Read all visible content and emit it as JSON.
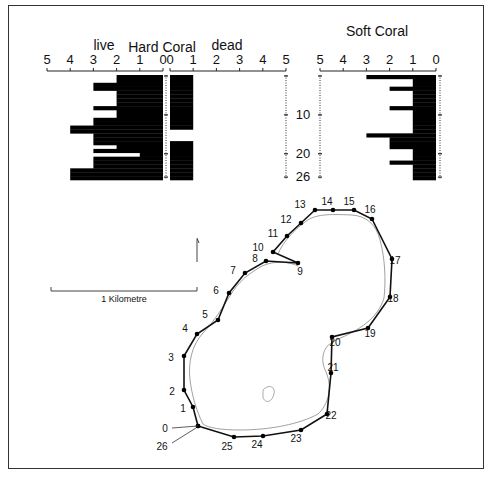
{
  "figure": {
    "hard_coral_title": "Hard Coral",
    "live_label": "live",
    "dead_label": "dead",
    "soft_coral_title": "Soft Coral",
    "scale_bar_label": "1 Kilometre",
    "depth_ticks": [
      "10",
      "20",
      "26"
    ]
  },
  "chart_data": [
    {
      "type": "bar",
      "orientation": "horizontal",
      "title": "Hard Coral — live",
      "xlabel": "live",
      "x_ticks": [
        "5",
        "4",
        "3",
        "2",
        "1",
        "0"
      ],
      "xlim": [
        5,
        0
      ],
      "categories": [
        0,
        1,
        2,
        3,
        4,
        5,
        6,
        7,
        8,
        9,
        10,
        11,
        12,
        13,
        14,
        15,
        16,
        17,
        18,
        19,
        20,
        21,
        22,
        23,
        24,
        25,
        26
      ],
      "values": [
        2,
        2,
        3,
        3,
        2,
        2,
        2,
        2,
        3,
        2,
        2,
        3,
        3,
        4,
        4,
        3,
        3,
        3,
        2,
        3,
        1,
        3,
        3,
        3,
        4,
        4,
        4
      ],
      "y_ticks": [
        "10",
        "20",
        "26"
      ]
    },
    {
      "type": "bar",
      "orientation": "horizontal",
      "title": "Hard Coral — dead",
      "xlabel": "dead",
      "x_ticks": [
        "0",
        "1",
        "2",
        "3",
        "4",
        "5"
      ],
      "xlim": [
        0,
        5
      ],
      "categories": [
        0,
        1,
        2,
        3,
        4,
        5,
        6,
        7,
        8,
        9,
        10,
        11,
        12,
        13,
        14,
        15,
        16,
        17,
        18,
        19,
        20,
        21,
        22,
        23,
        24,
        25,
        26
      ],
      "values": [
        1,
        1,
        1,
        1,
        1,
        1,
        1,
        1,
        1,
        1,
        1,
        1,
        1,
        1,
        0,
        0,
        0,
        1,
        1,
        1,
        1,
        1,
        1,
        1,
        1,
        1,
        1
      ],
      "y_ticks": [
        "10",
        "20",
        "26"
      ]
    },
    {
      "type": "bar",
      "orientation": "horizontal",
      "title": "Soft Coral",
      "x_ticks": [
        "5",
        "4",
        "3",
        "2",
        "1",
        "0"
      ],
      "xlim": [
        5,
        0
      ],
      "categories": [
        0,
        1,
        2,
        3,
        4,
        5,
        6,
        7,
        8,
        9,
        10,
        11,
        12,
        13,
        14,
        15,
        16,
        17,
        18,
        19,
        20,
        21,
        22,
        23,
        24,
        25,
        26
      ],
      "values": [
        3,
        1,
        1,
        2,
        1,
        1,
        1,
        1,
        2,
        1,
        1,
        1,
        1,
        1,
        1,
        3,
        2,
        2,
        2,
        1,
        1,
        1,
        2,
        1,
        1,
        1,
        1
      ],
      "y_ticks": [
        "10",
        "20",
        "26"
      ]
    }
  ],
  "map": {
    "sites": [
      {
        "id": "0",
        "x": 198,
        "y": 426,
        "lx": 165,
        "ly": 432
      },
      {
        "id": "1",
        "x": 193,
        "y": 407,
        "lx": 183,
        "ly": 412
      },
      {
        "id": "2",
        "x": 184,
        "y": 390,
        "lx": 172,
        "ly": 395
      },
      {
        "id": "3",
        "x": 184,
        "y": 356,
        "lx": 171,
        "ly": 361
      },
      {
        "id": "4",
        "x": 197,
        "y": 334,
        "lx": 185,
        "ly": 332
      },
      {
        "id": "5",
        "x": 218,
        "y": 320,
        "lx": 205,
        "ly": 318
      },
      {
        "id": "6",
        "x": 229,
        "y": 293,
        "lx": 216,
        "ly": 294
      },
      {
        "id": "7",
        "x": 245,
        "y": 273,
        "lx": 233,
        "ly": 274
      },
      {
        "id": "8",
        "x": 266,
        "y": 261,
        "lx": 255,
        "ly": 262
      },
      {
        "id": "9",
        "x": 298,
        "y": 263,
        "lx": 300,
        "ly": 275
      },
      {
        "id": "10",
        "x": 273,
        "y": 252,
        "lx": 258,
        "ly": 251
      },
      {
        "id": "11",
        "x": 287,
        "y": 236,
        "lx": 273,
        "ly": 237
      },
      {
        "id": "12",
        "x": 301,
        "y": 223,
        "lx": 286,
        "ly": 223
      },
      {
        "id": "13",
        "x": 315,
        "y": 210,
        "lx": 300,
        "ly": 208
      },
      {
        "id": "14",
        "x": 333,
        "y": 210,
        "lx": 327,
        "ly": 205
      },
      {
        "id": "15",
        "x": 354,
        "y": 210,
        "lx": 349,
        "ly": 205
      },
      {
        "id": "16",
        "x": 372,
        "y": 219,
        "lx": 370,
        "ly": 213
      },
      {
        "id": "17",
        "x": 392,
        "y": 259,
        "lx": 395,
        "ly": 264
      },
      {
        "id": "18",
        "x": 390,
        "y": 297,
        "lx": 393,
        "ly": 302
      },
      {
        "id": "19",
        "x": 368,
        "y": 328,
        "lx": 370,
        "ly": 337
      },
      {
        "id": "20",
        "x": 332,
        "y": 337,
        "lx": 335,
        "ly": 346
      },
      {
        "id": "21",
        "x": 331,
        "y": 373,
        "lx": 333,
        "ly": 371
      },
      {
        "id": "22",
        "x": 327,
        "y": 414,
        "lx": 331,
        "ly": 419
      },
      {
        "id": "23",
        "x": 301,
        "y": 430,
        "lx": 296,
        "ly": 442
      },
      {
        "id": "24",
        "x": 263,
        "y": 436,
        "lx": 257,
        "ly": 448
      },
      {
        "id": "25",
        "x": 234,
        "y": 437,
        "lx": 227,
        "ly": 450
      },
      {
        "id": "26",
        "x": 198,
        "y": 426,
        "lx": 162,
        "ly": 450
      }
    ]
  }
}
